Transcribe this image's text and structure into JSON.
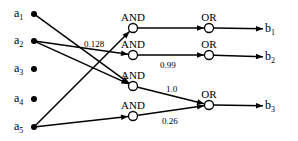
{
  "inputs": [
    {
      "id": "a1",
      "label": "a",
      "sub": "1",
      "x": 34,
      "y": 14
    },
    {
      "id": "a2",
      "label": "a",
      "sub": "2",
      "x": 34,
      "y": 41
    },
    {
      "id": "a3",
      "label": "a",
      "sub": "3",
      "x": 34,
      "y": 69
    },
    {
      "id": "a4",
      "label": "a",
      "sub": "4",
      "x": 34,
      "y": 99
    },
    {
      "id": "a5",
      "label": "a",
      "sub": "5",
      "x": 34,
      "y": 127
    }
  ],
  "and_gates": [
    {
      "id": "and1",
      "label": "AND",
      "x": 133,
      "y": 28
    },
    {
      "id": "and2",
      "label": "AND",
      "x": 133,
      "y": 55
    },
    {
      "id": "and3",
      "label": "AND",
      "x": 133,
      "y": 86
    },
    {
      "id": "and4",
      "label": "AND",
      "x": 133,
      "y": 116
    }
  ],
  "or_gates": [
    {
      "id": "or1",
      "label": "OR",
      "x": 209,
      "y": 28
    },
    {
      "id": "or2",
      "label": "OR",
      "x": 209,
      "y": 55
    },
    {
      "id": "or3",
      "label": "OR",
      "x": 209,
      "y": 105
    }
  ],
  "outputs": [
    {
      "id": "b1",
      "label": "b",
      "sub": "1",
      "x": 275,
      "y": 29
    },
    {
      "id": "b2",
      "label": "b",
      "sub": "2",
      "x": 275,
      "y": 57
    },
    {
      "id": "b3",
      "label": "b",
      "sub": "3",
      "x": 275,
      "y": 106
    }
  ],
  "edges": [
    {
      "from": "a1",
      "to": "and3",
      "weight": ""
    },
    {
      "from": "a2",
      "to": "and2",
      "weight": "0.128"
    },
    {
      "from": "a2",
      "to": "and3",
      "weight": ""
    },
    {
      "from": "a5",
      "to": "and1",
      "weight": ""
    },
    {
      "from": "a5",
      "to": "and4",
      "weight": ""
    },
    {
      "from": "and1",
      "to": "or1",
      "weight": ""
    },
    {
      "from": "and2",
      "to": "or2",
      "weight": "0.99"
    },
    {
      "from": "and3",
      "to": "or3",
      "weight": "1.0"
    },
    {
      "from": "and4",
      "to": "or3",
      "weight": "0.26"
    },
    {
      "from": "or1",
      "to": "b1",
      "weight": ""
    },
    {
      "from": "or2",
      "to": "b2",
      "weight": ""
    },
    {
      "from": "or3",
      "to": "b3",
      "weight": ""
    }
  ],
  "weight_labels": [
    {
      "text": "0.128",
      "x": 84,
      "y": 47
    },
    {
      "text": "0.99",
      "x": 160,
      "y": 68
    },
    {
      "text": "1.0",
      "x": 166,
      "y": 92
    },
    {
      "text": "0.26",
      "x": 162,
      "y": 124
    }
  ]
}
